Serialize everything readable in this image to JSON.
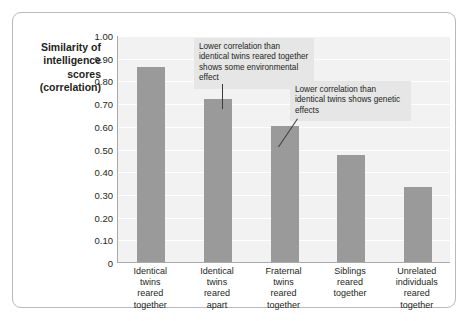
{
  "chart_data": {
    "type": "bar",
    "title": "",
    "xlabel": "",
    "ylabel": "Similarity of intelligence scores (correlation)",
    "ylabel_lines": [
      "Similarity of",
      "intelligence",
      "scores",
      "(correlation)"
    ],
    "categories": [
      "Identical twins reared together",
      "Identical twins reared apart",
      "Fraternal twins reared together",
      "Siblings reared together",
      "Unrelated individuals reared together"
    ],
    "category_lines": [
      [
        "Identical",
        "twins",
        "reared",
        "together"
      ],
      [
        "Identical",
        "twins",
        "reared",
        "apart"
      ],
      [
        "Fraternal",
        "twins",
        "reared",
        "together"
      ],
      [
        "Siblings",
        "reared",
        "together"
      ],
      [
        "Unrelated",
        "individuals",
        "reared",
        "together"
      ]
    ],
    "values": [
      0.86,
      0.72,
      0.6,
      0.47,
      0.33
    ],
    "ylim": [
      0,
      1.0
    ],
    "ytick_values": [
      1.0,
      0.9,
      0.8,
      0.7,
      0.6,
      0.5,
      0.4,
      0.3,
      0.2,
      0.1,
      0
    ],
    "ytick_labels": [
      "1.00",
      "0.90",
      "0.80",
      "0.70",
      "0.60",
      "0.50",
      "0.40",
      "0.30",
      "0.20",
      "0.10",
      "0"
    ],
    "grid": true,
    "legend": "none",
    "bar_color": "#9a9a9a",
    "plot_background": "#f2f2f2",
    "gridline_color": "#ffffff",
    "annotations": [
      {
        "text": "Lower correlation than identical twins reared together shows some environmental effect",
        "lines": [
          "Lower correlation than",
          "identical twins reared",
          "together shows some",
          "environmental effect"
        ],
        "points_to_category": "Identical twins reared apart"
      },
      {
        "text": "Lower correlation than identical twins shows genetic effects",
        "lines": [
          "Lower correlation than",
          "identical twins shows",
          "genetic effects"
        ],
        "points_to_category": "Fraternal twins reared together"
      }
    ]
  }
}
